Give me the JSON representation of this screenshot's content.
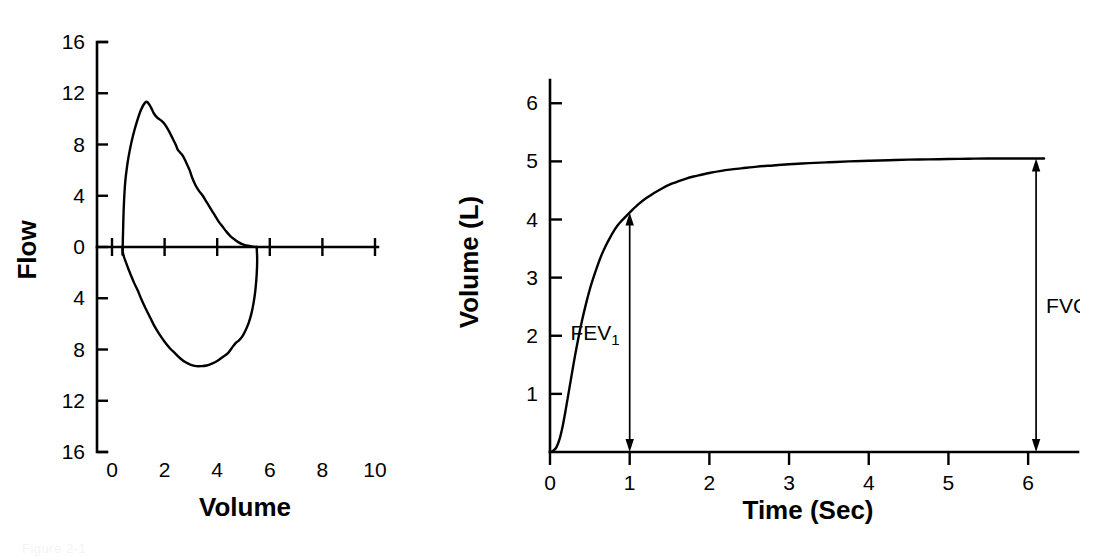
{
  "figure": {
    "caption": "Figure 2-1",
    "background": "#ffffff",
    "ink_color": "#000000"
  },
  "chart_data": [
    {
      "id": "flow-volume-loop",
      "type": "line",
      "title": "",
      "xlabel": "Volume",
      "ylabel": "Flow",
      "xlim": [
        0,
        10
      ],
      "ylim": [
        -16,
        16
      ],
      "xticks": [
        0,
        2,
        4,
        6,
        8,
        10
      ],
      "xticklabels": [
        "0",
        "2",
        "4",
        "6",
        "8",
        "10"
      ],
      "yticks": [
        16,
        12,
        8,
        4,
        0,
        -4,
        -8,
        -12,
        -16
      ],
      "yticklabels": [
        "16",
        "12",
        "8",
        "4",
        "0",
        "4",
        "8",
        "12",
        "16"
      ],
      "grid": false,
      "legend": "none",
      "notes": "Maximal expiratory-inspiratory flow-volume loop. Expiratory limb above zero, inspiratory limb below zero plotted with positive magnitude tick labels.",
      "series": [
        {
          "name": "Expiratory limb",
          "points": [
            [
              0.4,
              -0.6
            ],
            [
              0.42,
              1.2
            ],
            [
              0.45,
              3.2
            ],
            [
              0.5,
              5.0
            ],
            [
              0.58,
              6.4
            ],
            [
              0.68,
              7.6
            ],
            [
              0.8,
              8.7
            ],
            [
              0.95,
              9.8
            ],
            [
              1.1,
              10.7
            ],
            [
              1.25,
              11.25
            ],
            [
              1.35,
              11.3
            ],
            [
              1.48,
              10.9
            ],
            [
              1.6,
              10.4
            ],
            [
              1.72,
              10.1
            ],
            [
              1.85,
              9.9
            ],
            [
              2.0,
              9.6
            ],
            [
              2.15,
              9.1
            ],
            [
              2.3,
              8.5
            ],
            [
              2.42,
              8.0
            ],
            [
              2.5,
              7.6
            ],
            [
              2.58,
              7.4
            ],
            [
              2.7,
              7.1
            ],
            [
              2.82,
              6.6
            ],
            [
              2.95,
              6.0
            ],
            [
              3.05,
              5.4
            ],
            [
              3.18,
              4.8
            ],
            [
              3.3,
              4.4
            ],
            [
              3.45,
              4.0
            ],
            [
              3.6,
              3.5
            ],
            [
              3.75,
              3.0
            ],
            [
              3.9,
              2.5
            ],
            [
              4.05,
              2.0
            ],
            [
              4.2,
              1.6
            ],
            [
              4.35,
              1.2
            ],
            [
              4.5,
              0.85
            ],
            [
              4.65,
              0.6
            ],
            [
              4.8,
              0.38
            ],
            [
              4.95,
              0.22
            ],
            [
              5.1,
              0.12
            ],
            [
              5.3,
              0.05
            ],
            [
              5.5,
              0.0
            ]
          ]
        },
        {
          "name": "Inspiratory limb",
          "points": [
            [
              5.5,
              0.0
            ],
            [
              5.52,
              -1.0
            ],
            [
              5.5,
              -2.2
            ],
            [
              5.45,
              -3.4
            ],
            [
              5.38,
              -4.4
            ],
            [
              5.3,
              -5.2
            ],
            [
              5.2,
              -5.9
            ],
            [
              5.08,
              -6.5
            ],
            [
              4.95,
              -7.0
            ],
            [
              4.82,
              -7.3
            ],
            [
              4.7,
              -7.5
            ],
            [
              4.55,
              -7.9
            ],
            [
              4.4,
              -8.3
            ],
            [
              4.2,
              -8.6
            ],
            [
              4.0,
              -8.9
            ],
            [
              3.8,
              -9.1
            ],
            [
              3.6,
              -9.25
            ],
            [
              3.4,
              -9.3
            ],
            [
              3.2,
              -9.3
            ],
            [
              3.0,
              -9.2
            ],
            [
              2.8,
              -9.0
            ],
            [
              2.6,
              -8.7
            ],
            [
              2.4,
              -8.3
            ],
            [
              2.2,
              -7.9
            ],
            [
              2.0,
              -7.4
            ],
            [
              1.8,
              -6.8
            ],
            [
              1.62,
              -6.2
            ],
            [
              1.45,
              -5.5
            ],
            [
              1.28,
              -4.8
            ],
            [
              1.12,
              -4.1
            ],
            [
              0.98,
              -3.4
            ],
            [
              0.84,
              -2.8
            ],
            [
              0.72,
              -2.2
            ],
            [
              0.62,
              -1.7
            ],
            [
              0.53,
              -1.2
            ],
            [
              0.46,
              -0.8
            ],
            [
              0.41,
              -0.4
            ],
            [
              0.4,
              -0.1
            ]
          ]
        }
      ]
    },
    {
      "id": "volume-time-spirogram",
      "type": "line",
      "title": "",
      "xlabel": "Time (Sec)",
      "ylabel": "Volume (L)",
      "xlim": [
        0,
        6.4
      ],
      "ylim": [
        0,
        6.4
      ],
      "xticks": [
        0,
        1,
        2,
        3,
        4,
        5,
        6
      ],
      "xticklabels": [
        "0",
        "1",
        "2",
        "3",
        "4",
        "5",
        "6"
      ],
      "yticks": [
        1,
        2,
        3,
        4,
        5,
        6
      ],
      "yticklabels": [
        "1",
        "2",
        "3",
        "4",
        "5",
        "6"
      ],
      "grid": false,
      "legend": "none",
      "notes": "Forced vital capacity spirogram. FEV1 measured at 1 second, FVC is total exhaled volume.",
      "series": [
        {
          "name": "Exhaled volume",
          "points": [
            [
              0.0,
              0.0
            ],
            [
              0.04,
              0.02
            ],
            [
              0.08,
              0.08
            ],
            [
              0.12,
              0.22
            ],
            [
              0.16,
              0.45
            ],
            [
              0.2,
              0.75
            ],
            [
              0.25,
              1.15
            ],
            [
              0.3,
              1.55
            ],
            [
              0.35,
              1.92
            ],
            [
              0.4,
              2.25
            ],
            [
              0.45,
              2.54
            ],
            [
              0.5,
              2.8
            ],
            [
              0.55,
              3.02
            ],
            [
              0.6,
              3.22
            ],
            [
              0.65,
              3.4
            ],
            [
              0.7,
              3.55
            ],
            [
              0.75,
              3.68
            ],
            [
              0.8,
              3.8
            ],
            [
              0.85,
              3.9
            ],
            [
              0.9,
              3.98
            ],
            [
              0.95,
              4.05
            ],
            [
              1.0,
              4.12
            ],
            [
              1.1,
              4.25
            ],
            [
              1.2,
              4.36
            ],
            [
              1.3,
              4.45
            ],
            [
              1.4,
              4.53
            ],
            [
              1.5,
              4.6
            ],
            [
              1.6,
              4.65
            ],
            [
              1.7,
              4.7
            ],
            [
              1.8,
              4.74
            ],
            [
              1.9,
              4.77
            ],
            [
              2.0,
              4.8
            ],
            [
              2.2,
              4.85
            ],
            [
              2.4,
              4.88
            ],
            [
              2.6,
              4.91
            ],
            [
              2.8,
              4.93
            ],
            [
              3.0,
              4.95
            ],
            [
              3.25,
              4.97
            ],
            [
              3.5,
              4.985
            ],
            [
              3.75,
              5.0
            ],
            [
              4.0,
              5.01
            ],
            [
              4.25,
              5.02
            ],
            [
              4.5,
              5.03
            ],
            [
              4.75,
              5.035
            ],
            [
              5.0,
              5.04
            ],
            [
              5.25,
              5.045
            ],
            [
              5.5,
              5.05
            ],
            [
              5.75,
              5.05
            ],
            [
              6.0,
              5.05
            ],
            [
              6.2,
              5.05
            ]
          ]
        }
      ],
      "annotations": [
        {
          "name": "FEV1",
          "label": "FEV",
          "subscript": "1",
          "x": 1.0,
          "y_from": 0.0,
          "y_to": 4.12,
          "value": 4.1,
          "unit": "L",
          "label_side": "left"
        },
        {
          "name": "FVC",
          "label": "FVC",
          "subscript": "",
          "x": 6.1,
          "y_from": 0.0,
          "y_to": 5.05,
          "value": 5.05,
          "unit": "L",
          "label_side": "right"
        }
      ]
    }
  ]
}
